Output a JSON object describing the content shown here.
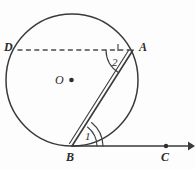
{
  "figure": {
    "kind": "circle-tangent-chord-geometry-diagram",
    "background_color": "#fdfdfd",
    "stroke_color": "#3a3a3a",
    "label_color": "#2b2b2b",
    "width": 195,
    "height": 170
  },
  "points": {
    "D": {
      "label": "D",
      "x": 17,
      "y": 50,
      "label_x": 4,
      "label_y": 41
    },
    "A": {
      "label": "A",
      "x": 133,
      "y": 50,
      "label_x": 139,
      "label_y": 41
    },
    "B": {
      "label": "B",
      "x": 72,
      "y": 146,
      "label_x": 66,
      "label_y": 151
    },
    "C": {
      "label": "C",
      "x": 166,
      "y": 146,
      "label_x": 161,
      "label_y": 151
    },
    "O": {
      "label": "O",
      "x": 72,
      "y": 80,
      "label_x": 55,
      "label_y": 74
    }
  },
  "angles": {
    "angle_1": {
      "label": "1",
      "label_x": 85,
      "label_y": 131
    },
    "angle_2": {
      "label": "2",
      "label_x": 112,
      "label_y": 57
    }
  },
  "circle": {
    "center_x": 72,
    "center_y": 80,
    "radius": 66
  },
  "segments": {
    "chord_DA": "D to A (dashed chord)",
    "chord_AB": "A to B (chord)",
    "tangent_BC": "B to C (tangent ray with arrowhead)"
  }
}
